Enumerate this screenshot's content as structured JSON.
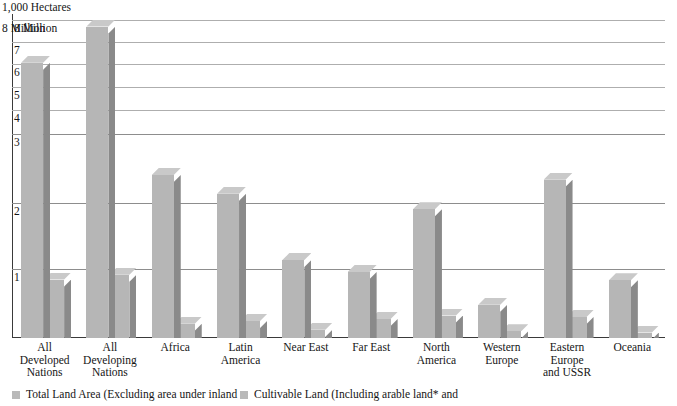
{
  "chart_data": {
    "type": "bar",
    "title": "",
    "subtitle": "",
    "unit_label_line1": "1,000 Hectares",
    "unit_label_line2": "8 Million",
    "ylabel": "",
    "xlabel": "",
    "ylim": [
      0,
      8
    ],
    "grid": true,
    "legend_position": "bottom-left",
    "yticks": [
      "8 Million",
      "7",
      "6",
      "5",
      "4",
      "3",
      "2",
      "1"
    ],
    "ytick_values": [
      8,
      7,
      6,
      5,
      4,
      3,
      2,
      1
    ],
    "categories": [
      "All Developed Nations",
      "All Developing Nations",
      "Africa",
      "Latin America",
      "Near East",
      "Far East",
      "North America",
      "Western Europe",
      "Eastern Europe and USSR",
      "Oceania"
    ],
    "category_lines": [
      [
        "All",
        "Developed",
        "Nations"
      ],
      [
        "All",
        "Developing",
        "Nations"
      ],
      [
        "Africa"
      ],
      [
        "Latin",
        "America"
      ],
      [
        "Near East"
      ],
      [
        "Far East"
      ],
      [
        "North",
        "America"
      ],
      [
        "Western",
        "Europe"
      ],
      [
        "Eastern",
        "Europe",
        "and USSR"
      ],
      [
        "Oceania"
      ]
    ],
    "series": [
      {
        "name": "Total Land Area (Excluding area under inland",
        "color": "#b6b6b6",
        "values": [
          6.1,
          7.75,
          2.42,
          2.15,
          1.15,
          0.97,
          1.92,
          0.49,
          2.35,
          0.85
        ]
      },
      {
        "name": "Cultivable Land (Including arable land* and",
        "color": "#b6b6b6",
        "values": [
          0.86,
          0.93,
          0.21,
          0.25,
          0.12,
          0.28,
          0.33,
          0.1,
          0.31,
          0.08
        ]
      }
    ]
  },
  "legend": {
    "items": [
      {
        "label": "Total Land Area (Excluding area under inland",
        "color": "#b9b9b9"
      },
      {
        "label": "Cultivable Land (Including arable land* and",
        "color": "#b9b9b9"
      }
    ]
  },
  "colors": {
    "bar_front": "#b6b6b6",
    "bar_side": "#8a8a8a",
    "bar_top": "#c9c9c9",
    "gridline": "#8d8d8d",
    "axis": "#3a3a3a",
    "background": "#ffffff",
    "text": "#151515"
  }
}
